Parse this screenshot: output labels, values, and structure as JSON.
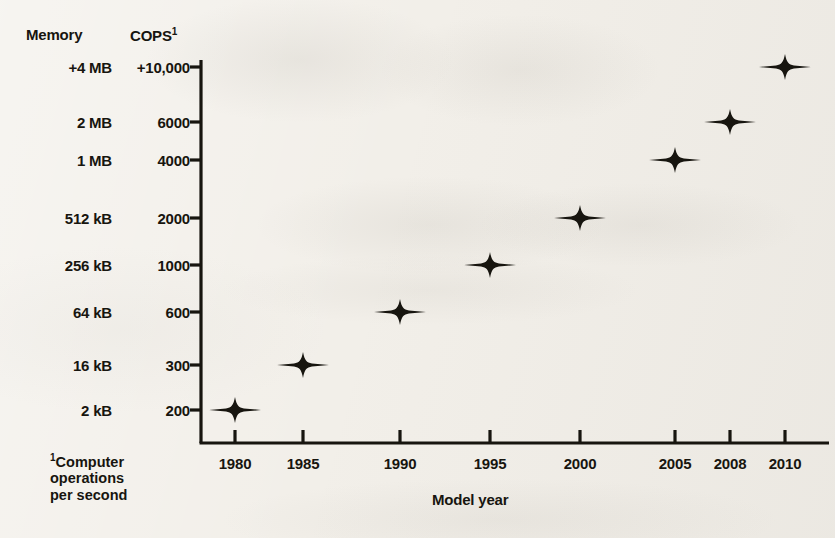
{
  "headers": {
    "memory": "Memory",
    "cops": "COPS",
    "cops_superscript": "1"
  },
  "footnote": {
    "superscript": "1",
    "line1": "Computer",
    "line2": "operations",
    "line3": "per second"
  },
  "axis_title_x": "Model year",
  "colors": {
    "ink": "#17150f",
    "paper": "#f2efe9"
  },
  "chart_data": {
    "type": "scatter",
    "title": "",
    "xlabel": "Model year",
    "ylabel": "COPS",
    "y_secondary_label": "Memory",
    "grid": false,
    "legend": "none",
    "marker": "four-pointed-star",
    "x": [
      1980,
      1985,
      1990,
      1995,
      2000,
      2005,
      2008,
      2010
    ],
    "categories": [
      "1980",
      "1985",
      "1990",
      "1995",
      "2000",
      "2005",
      "2008",
      "2010"
    ],
    "values": [
      200,
      300,
      600,
      1000,
      2000,
      4000,
      6000,
      10000
    ],
    "series": [
      {
        "name": "COPS",
        "values": [
          200,
          300,
          600,
          1000,
          2000,
          4000,
          6000,
          10000
        ]
      },
      {
        "name": "Memory",
        "values": [
          "2 kB",
          "16 kB",
          "64 kB",
          "256 kB",
          "512 kB",
          "1 MB",
          "2 MB",
          "+4 MB"
        ]
      }
    ],
    "points": [
      {
        "year": "1980",
        "cops": "200",
        "memory": "2 kB"
      },
      {
        "year": "1985",
        "cops": "300",
        "memory": "16 kB"
      },
      {
        "year": "1990",
        "cops": "600",
        "memory": "64 kB"
      },
      {
        "year": "1995",
        "cops": "1000",
        "memory": "256 kB"
      },
      {
        "year": "2000",
        "cops": "2000",
        "memory": "512 kB"
      },
      {
        "year": "2005",
        "cops": "4000",
        "memory": "1 MB"
      },
      {
        "year": "2008",
        "cops": "6000",
        "memory": "2 MB"
      },
      {
        "year": "2010",
        "cops": "+10,000",
        "memory": "+4 MB"
      }
    ],
    "y_ticks": [
      {
        "cops": "+10,000",
        "memory": "+4 MB"
      },
      {
        "cops": "6000",
        "memory": "2 MB"
      },
      {
        "cops": "4000",
        "memory": "1 MB"
      },
      {
        "cops": "2000",
        "memory": "512 kB"
      },
      {
        "cops": "1000",
        "memory": "256 kB"
      },
      {
        "cops": "600",
        "memory": "64 kB"
      },
      {
        "cops": "300",
        "memory": "16 kB"
      },
      {
        "cops": "200",
        "memory": "2 kB"
      }
    ],
    "x_ticks": [
      "1980",
      "1985",
      "1990",
      "1995",
      "2000",
      "2005",
      "2008",
      "2010"
    ]
  }
}
